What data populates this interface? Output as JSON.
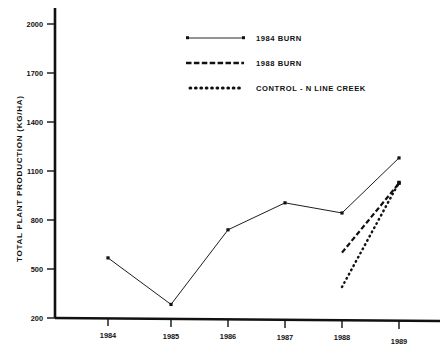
{
  "chart_data": {
    "type": "line",
    "title": "",
    "xlabel": "",
    "ylabel": "TOTAL PLANT PRODUCTION (KG/HA)",
    "x": [
      "1984",
      "1985",
      "1986",
      "1987",
      "1988",
      "1989"
    ],
    "xlim": [
      1983.5,
      1989.6
    ],
    "ylim": [
      200,
      2000
    ],
    "yticks": [
      200,
      500,
      800,
      1100,
      1400,
      1700,
      2000
    ],
    "xticks": [
      "1984",
      "1985",
      "1986",
      "1987",
      "1988",
      "1989"
    ],
    "grid": false,
    "legend_position": "top-center",
    "series": [
      {
        "name": "1984 BURN",
        "style": "solid",
        "x": [
          "1984",
          "1985",
          "1986",
          "1987",
          "1988",
          "1989"
        ],
        "values": [
          568,
          283,
          740,
          905,
          843,
          1180
        ]
      },
      {
        "name": "1988 BURN",
        "style": "dashed",
        "x": [
          "1988",
          "1989"
        ],
        "values": [
          600,
          1025
        ]
      },
      {
        "name": "CONTROL - N LINE CREEK",
        "style": "dotted",
        "x": [
          "1988",
          "1989"
        ],
        "values": [
          390,
          1030
        ]
      }
    ]
  },
  "legend": {
    "entries": [
      {
        "label": "1984 BURN",
        "style": "solid"
      },
      {
        "label": "1988 BURN",
        "style": "dashed"
      },
      {
        "label": "CONTROL - N LINE CREEK",
        "style": "dotted"
      }
    ]
  },
  "axes": {
    "y_label": "TOTAL PLANT PRODUCTION (KG/HA)",
    "y_ticks": [
      "2000",
      "1700",
      "1400",
      "1100",
      "800",
      "500",
      "200"
    ],
    "x_ticks": [
      "1984",
      "1985",
      "1986",
      "1987",
      "1988",
      "1989"
    ]
  },
  "caption": {
    "text": ""
  },
  "colors": {
    "ink": "#111111",
    "background": "#ffffff"
  }
}
